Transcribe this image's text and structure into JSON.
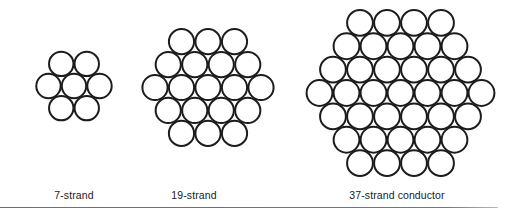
{
  "figure": {
    "stroke_color": "#1c1c1c",
    "stroke_width": 2,
    "background": "#ffffff",
    "divider_color": "#777777"
  },
  "conductors": [
    {
      "id": "7-strand",
      "label": "7-strand",
      "strand_count": 7,
      "layers": 1,
      "center": [
        74,
        86
      ],
      "pitch": 25.5,
      "radius": 12.2,
      "label_x": 74
    },
    {
      "id": "19-strand",
      "label": "19-strand",
      "strand_count": 19,
      "layers": 2,
      "center": [
        208,
        87.5
      ],
      "pitch": 26.5,
      "radius": 12.6,
      "label_x": 194
    },
    {
      "id": "37-strand",
      "label": "37-strand conductor",
      "strand_count": 37,
      "layers": 3,
      "center": [
        400.5,
        93
      ],
      "pitch": 27,
      "radius": 12.9,
      "label_x": 397
    }
  ]
}
